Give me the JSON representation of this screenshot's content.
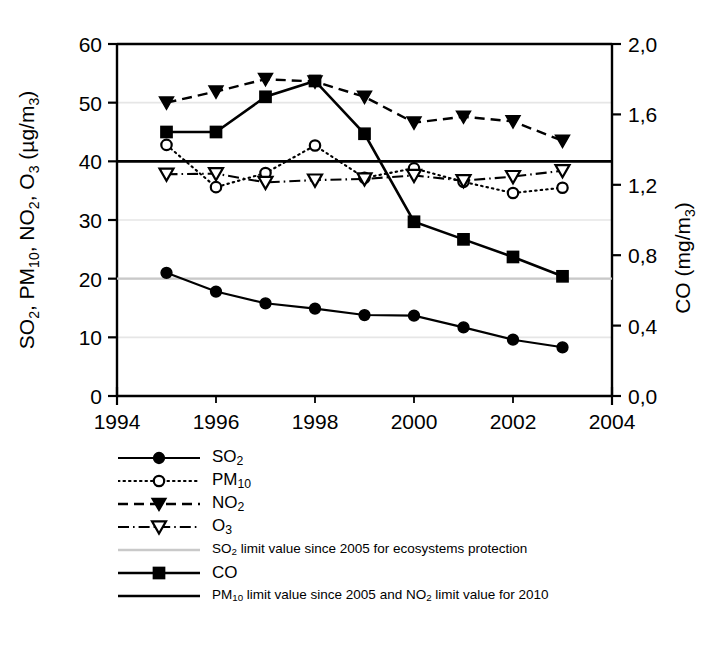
{
  "chart_data": {
    "type": "line",
    "title": "",
    "xlabel": "",
    "ylabel": "SO2, PM10, NO2, O3 (ug/m3)",
    "ylabel_right": "CO (mg/m3)",
    "x": [
      1995,
      1996,
      1997,
      1998,
      1999,
      2000,
      2001,
      2002,
      2003
    ],
    "xlim": [
      1994,
      2004
    ],
    "xticks": [
      1994,
      1996,
      1998,
      2000,
      2002,
      2004
    ],
    "xtick_labels": [
      "1994",
      "1996",
      "1998",
      "2000",
      "2002",
      "2004"
    ],
    "ylim": [
      0,
      60
    ],
    "yticks": [
      0,
      10,
      20,
      30,
      40,
      50,
      60
    ],
    "ytick_labels": [
      "0",
      "10",
      "20",
      "30",
      "40",
      "50",
      "60"
    ],
    "ylim_right": [
      0.0,
      2.0
    ],
    "yticks_right": [
      0.0,
      0.4,
      0.8,
      1.2,
      1.6,
      2.0
    ],
    "ytick_labels_right": [
      "0,0",
      "0,4",
      "0,8",
      "1,2",
      "1,6",
      "2,0"
    ],
    "grid": true,
    "legend_position": "below-left",
    "series": [
      {
        "name": "SO2",
        "axis": "left",
        "marker": "filled-circle",
        "line": "solid",
        "values": [
          21.0,
          17.8,
          15.8,
          14.9,
          13.8,
          13.7,
          11.7,
          9.6,
          8.3
        ]
      },
      {
        "name": "PM10",
        "axis": "left",
        "marker": "open-circle",
        "line": "dotted",
        "values": [
          42.8,
          35.6,
          38.0,
          42.7,
          37.2,
          38.8,
          36.5,
          34.6,
          35.5
        ]
      },
      {
        "name": "NO2",
        "axis": "left",
        "marker": "filled-triangle-down",
        "line": "dashed",
        "values": [
          50.0,
          51.9,
          54.0,
          53.6,
          51.0,
          46.6,
          47.6,
          46.8,
          43.5
        ]
      },
      {
        "name": "O3",
        "axis": "left",
        "marker": "open-triangle-down",
        "line": "dash-dot",
        "values": [
          37.8,
          37.9,
          36.4,
          36.8,
          37.0,
          37.6,
          36.7,
          37.4,
          38.4
        ]
      },
      {
        "name": "CO",
        "axis": "right",
        "marker": "filled-square",
        "line": "solid",
        "values": [
          1.5,
          1.5,
          1.7,
          1.79,
          1.49,
          0.99,
          0.89,
          0.79,
          0.68
        ]
      }
    ],
    "reference_lines": [
      {
        "name": "SO2 limit value since 2005 for ecosystems protection",
        "value": 20,
        "axis": "left",
        "color": "#c9c9c9",
        "style": "solid-thin"
      },
      {
        "name": "PM10 limit value since 2005 and NO2 limit value for 2010",
        "value": 40,
        "axis": "left",
        "color": "#000000",
        "style": "solid-thick"
      }
    ]
  },
  "axes": {
    "left_title_parts": [
      "SO",
      "2",
      ", PM",
      "10",
      ", NO",
      "2",
      ", O",
      "3",
      " (µg/m",
      "3",
      ")"
    ],
    "right_title_parts": [
      "CO (mg/m",
      "3",
      ")"
    ]
  },
  "legend": {
    "items": [
      {
        "key": "so2-key",
        "label_html": "SO<sub>2</sub>",
        "size": "normal"
      },
      {
        "key": "pm10-key",
        "label_html": "PM<sub>10</sub>",
        "size": "normal"
      },
      {
        "key": "no2-key",
        "label_html": "NO<sub>2</sub>",
        "size": "normal"
      },
      {
        "key": "o3-key",
        "label_html": "O<sub>3</sub>",
        "size": "normal"
      },
      {
        "key": "so2-limit-key",
        "label_html": "SO<sub>2</sub> limit value since 2005 for ecosystems protection",
        "size": "small"
      },
      {
        "key": "co-key",
        "label_html": "CO",
        "size": "normal"
      },
      {
        "key": "pm10-limit-key",
        "label_html": "PM<sub>10</sub> limit value since 2005 and NO<sub>2</sub> limit value for 2010",
        "size": "small"
      }
    ]
  },
  "colors": {
    "foreground": "#000000",
    "background": "#ffffff",
    "gridline": "#e6e6e6",
    "so2_limit_line": "#c9c9c9"
  }
}
